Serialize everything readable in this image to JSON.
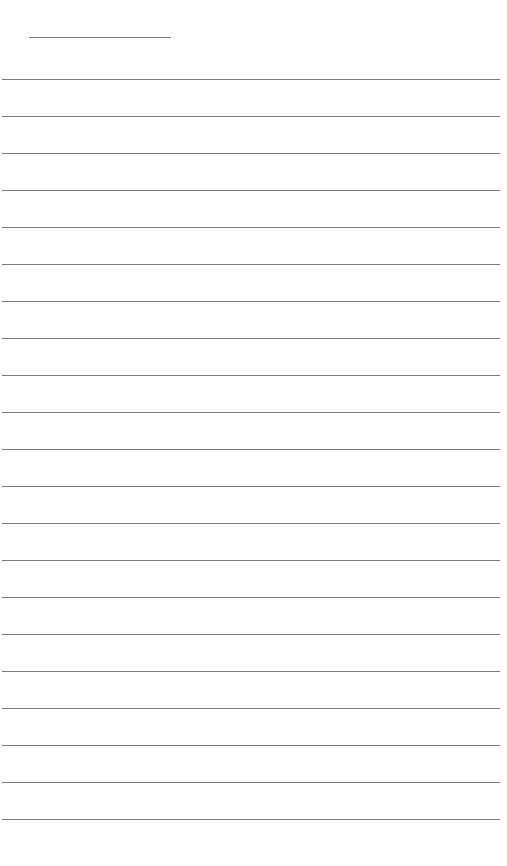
{
  "page": {
    "type": "blank lined paper",
    "background_color": "#ffffff",
    "line_color": "#7a7a7a",
    "title_line": {
      "x": 29,
      "y": 37,
      "width": 142
    },
    "ruled_lines": {
      "count": 21,
      "first_y": 79,
      "spacing": 37,
      "x": 2,
      "width": 498
    }
  }
}
